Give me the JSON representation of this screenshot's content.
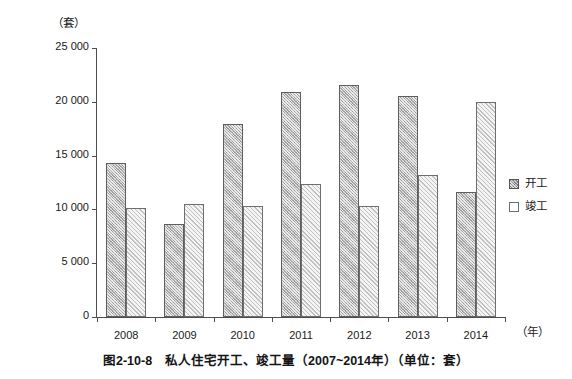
{
  "unit_top": "（套）",
  "xaxis_unit": "（年）",
  "caption": "图2-10-8　私人住宅开工、竣工量（2007~2014年）（单位：套）",
  "legend": {
    "items": [
      {
        "label": "开工",
        "swatch": "hatched-gray-swatch"
      },
      {
        "label": "竣工",
        "swatch": "white-swatch"
      }
    ]
  },
  "chart_data": {
    "type": "bar",
    "title": "图2-10-8　私人住宅开工、竣工量（2007~2014年）（单位：套）",
    "xlabel": "（年）",
    "ylabel": "（套）",
    "ylim": [
      0,
      25000
    ],
    "ytick_labels": [
      "0",
      "5 000",
      "10 000",
      "15 000",
      "20 000",
      "25 000"
    ],
    "ytick_values": [
      0,
      5000,
      10000,
      15000,
      20000,
      25000
    ],
    "grid": false,
    "legend_position": "right",
    "categories": [
      "2008",
      "2009",
      "2010",
      "2011",
      "2012",
      "2013",
      "2014"
    ],
    "series": [
      {
        "name": "开工",
        "values": [
          14300,
          8600,
          17900,
          20900,
          21600,
          20500,
          11600
        ]
      },
      {
        "name": "竣工",
        "values": [
          10100,
          10500,
          10300,
          12400,
          10300,
          13200,
          20000
        ]
      }
    ]
  }
}
